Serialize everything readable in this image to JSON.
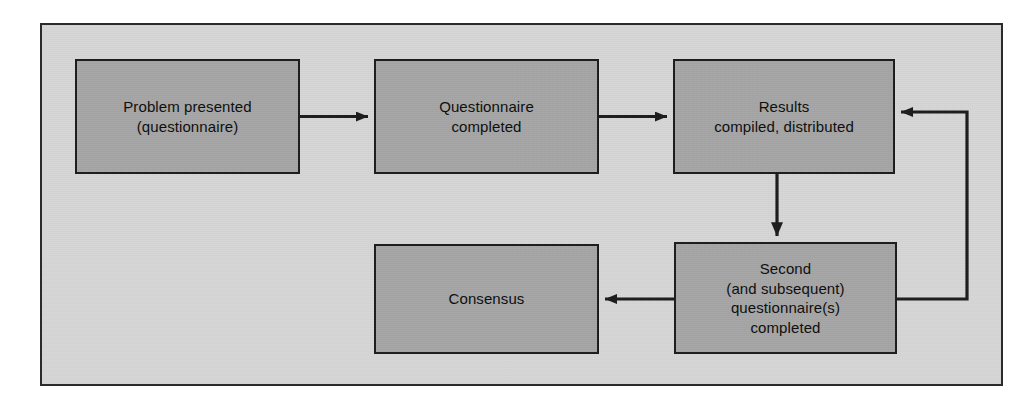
{
  "figure": {
    "type": "flowchart",
    "panel": {
      "background_color": "#d7d7d7",
      "border_color": "#2b2b2b"
    },
    "node_style": {
      "fill_color": "#a6a6a6",
      "border_color": "#1c1c1c",
      "text_color": "#0d0d0d"
    },
    "edge_color": "#1c1c1c"
  },
  "nodes": [
    {
      "id": "problem",
      "label": "Problem presented\n(questionnaire)",
      "line1": "Problem presented",
      "line2": "(questionnaire)"
    },
    {
      "id": "questionnaire",
      "label": "Questionnaire\ncompleted",
      "line1": "Questionnaire",
      "line2": "completed"
    },
    {
      "id": "results",
      "label": "Results\ncompiled, distributed",
      "line1": "Results",
      "line2": "compiled, distributed"
    },
    {
      "id": "second",
      "label": "Second\n(and subsequent)\nquestionnaire(s)\ncompleted",
      "line1": "Second",
      "line2": "(and subsequent)",
      "line3": "questionnaire(s)",
      "line4": "completed"
    },
    {
      "id": "consensus",
      "label": "Consensus",
      "line1": "Consensus"
    }
  ],
  "edges": [
    {
      "id": "problem-to-questionnaire",
      "from": "problem",
      "to": "questionnaire",
      "direction": "right",
      "label": ""
    },
    {
      "id": "questionnaire-to-results",
      "from": "questionnaire",
      "to": "results",
      "direction": "right",
      "label": ""
    },
    {
      "id": "results-to-second",
      "from": "results",
      "to": "second",
      "direction": "down",
      "label": ""
    },
    {
      "id": "second-to-consensus",
      "from": "second",
      "to": "consensus",
      "direction": "left",
      "label": ""
    },
    {
      "id": "second-to-results-feedback",
      "from": "second",
      "to": "results",
      "direction": "loop-right-up",
      "label": ""
    }
  ]
}
